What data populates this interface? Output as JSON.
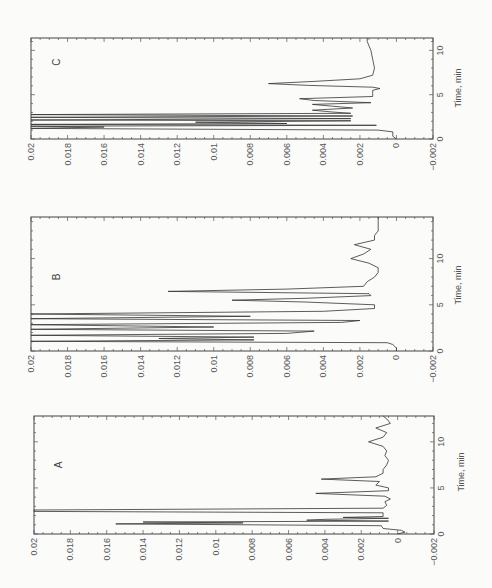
{
  "chart_data": [
    {
      "type": "line",
      "panel": "C",
      "title": "C",
      "xlabel": "Time, min",
      "ylabel": "",
      "xlim": [
        0,
        11.4
      ],
      "ylim": [
        -0.002,
        0.02
      ],
      "x_ticks": [
        0,
        5,
        10
      ],
      "y_ticks": [
        "0.02",
        "0.018",
        "0.016",
        "0.014",
        "0.012",
        "0.01",
        "0.008",
        "0.006",
        "0.004",
        "0.002",
        "0",
        "-0.002"
      ],
      "orientation": "rotated 90deg (value axis horizontal, time axis vertical)",
      "series": [
        {
          "name": "C",
          "x": [
            0,
            0.3,
            0.8,
            1.0,
            1.2,
            1.35,
            1.45,
            1.55,
            1.65,
            1.75,
            1.9,
            2.05,
            2.15,
            2.3,
            2.45,
            2.6,
            2.75,
            2.9,
            3.05,
            3.25,
            3.5,
            3.7,
            3.9,
            4.1,
            4.35,
            4.55,
            4.8,
            5.1,
            5.5,
            5.7,
            5.85,
            6.05,
            6.25,
            6.5,
            6.8,
            7.2,
            8,
            9,
            10,
            11,
            11.4
          ],
          "y": [
            0,
            0.0002,
            0.0002,
            0.001,
            0.02,
            0.016,
            0.02,
            0.0011,
            0.02,
            0.006,
            0.011,
            0.0025,
            0.02,
            0.0025,
            0.02,
            0.0024,
            0.02,
            0.0025,
            0.0035,
            0.0046,
            0.0024,
            0.0035,
            0.0046,
            0.0014,
            0.0045,
            0.0053,
            0.0013,
            0.0013,
            0.0013,
            0.0009,
            0.0013,
            0.0048,
            0.007,
            0.0045,
            0.002,
            0.0013,
            0.0012,
            0.0013,
            0.0014,
            0.0016,
            0.0016
          ]
        }
      ]
    },
    {
      "type": "line",
      "panel": "B",
      "title": "B",
      "xlabel": "Time, min",
      "ylabel": "",
      "xlim": [
        0,
        14.5
      ],
      "ylim": [
        -0.002,
        0.02
      ],
      "x_ticks": [
        0,
        5,
        10
      ],
      "y_ticks": [
        "0.02",
        "0.018",
        "0.016",
        "0.014",
        "0.012",
        "0.01",
        "0.008",
        "0.006",
        "0.004",
        "0.002",
        "0",
        "-0.002"
      ],
      "orientation": "rotated 90deg (value axis horizontal, time axis vertical)",
      "series": [
        {
          "name": "B",
          "x": [
            0,
            0.3,
            0.7,
            0.9,
            1.05,
            1.2,
            1.35,
            1.5,
            1.7,
            1.9,
            2.15,
            2.35,
            2.6,
            2.85,
            3.1,
            3.3,
            3.5,
            3.75,
            4.0,
            4.3,
            4.6,
            5.0,
            5.3,
            5.5,
            5.7,
            6.0,
            6.2,
            6.45,
            6.7,
            7.0,
            7.5,
            8,
            8.5,
            9,
            9.5,
            10,
            10.5,
            11,
            11.5,
            12,
            12.5,
            13,
            14,
            14.5
          ],
          "y": [
            0,
            0,
            0.0002,
            0.0005,
            0.02,
            0.0078,
            0.013,
            0.0078,
            0.02,
            0.006,
            0.0045,
            0.02,
            0.01,
            0.02,
            0.003,
            0.002,
            0.02,
            0.008,
            0.02,
            0.004,
            0.0012,
            0.0012,
            0.005,
            0.009,
            0.005,
            0.0014,
            0.0015,
            0.0125,
            0.006,
            0.0018,
            0.0016,
            0.0012,
            0.001,
            0.001,
            0.0015,
            0.0025,
            0.0018,
            0.0014,
            0.0023,
            0.0012,
            0.0012,
            0.001,
            0.001,
            0.001
          ]
        }
      ]
    },
    {
      "type": "line",
      "panel": "A",
      "title": "A",
      "xlabel": "Time, min",
      "ylabel": "",
      "xlim": [
        0,
        12.8
      ],
      "ylim": [
        -0.002,
        0.02
      ],
      "x_ticks": [
        0,
        5,
        10
      ],
      "y_ticks": [
        "0.02",
        "0.018",
        "0.016",
        "0.014",
        "0.012",
        "0.01",
        "0.008",
        "0.006",
        "0.004",
        "0.002",
        "0",
        "-0.002"
      ],
      "orientation": "rotated 90deg (value axis horizontal, time axis vertical)",
      "series": [
        {
          "name": "A",
          "x": [
            0,
            0.2,
            0.4,
            0.6,
            0.9,
            1.1,
            1.2,
            1.3,
            1.4,
            1.5,
            1.6,
            1.7,
            1.8,
            1.9,
            2.1,
            2.3,
            2.45,
            2.6,
            2.8,
            3.1,
            3.5,
            3.8,
            4.1,
            4.4,
            4.7,
            5.0,
            5.3,
            5.7,
            5.95,
            6.2,
            6.6,
            7,
            7.5,
            8,
            8.5,
            9,
            9.5,
            10,
            10.5,
            11,
            11.5,
            12,
            12.5,
            12.8
          ],
          "y": [
            0,
            -0.0004,
            -0.0002,
            0.0008,
            0.0009,
            0.0155,
            0.0085,
            0.014,
            0.0005,
            0.005,
            0.004,
            0.0005,
            0.003,
            0.0008,
            0.0008,
            0.0008,
            0.02,
            0.02,
            0.0008,
            0.0006,
            0.0007,
            0.0004,
            0.0007,
            0.0045,
            0.0005,
            0.0005,
            0.0012,
            0.001,
            0.0042,
            0.0012,
            0.0008,
            0.0008,
            0.0006,
            0.0005,
            0.0007,
            0.0006,
            0.0008,
            0.0016,
            0.0008,
            0.0006,
            0.0012,
            0.0004,
            0.0006,
            0.0008
          ]
        }
      ]
    }
  ],
  "panels": [
    {
      "id": "C",
      "label": "C",
      "y_tick_labels": [
        "0.02",
        "0.018",
        "0.016",
        "0.014",
        "0.012",
        "0.01",
        "0.008",
        "0.006",
        "0.004",
        "0.002",
        "0",
        "−0.002"
      ],
      "time_tick_labels": [
        "0",
        "5",
        "10"
      ],
      "time_label": "Time, min"
    },
    {
      "id": "B",
      "label": "B",
      "y_tick_labels": [
        "0.02",
        "0.018",
        "0.016",
        "0.014",
        "0.012",
        "0.01",
        "0.008",
        "0.006",
        "0.004",
        "0.002",
        "0",
        "−0.002"
      ],
      "time_tick_labels": [
        "0",
        "5",
        "10"
      ],
      "time_label": "Time, min"
    },
    {
      "id": "A",
      "label": "A",
      "y_tick_labels": [
        "0.02",
        "0.018",
        "0.016",
        "0.014",
        "0.012",
        "0.01",
        "0.008",
        "0.006",
        "0.004",
        "0.002",
        "0",
        "−0.002"
      ],
      "time_tick_labels": [
        "0",
        "5",
        "10"
      ],
      "time_label": "Time, min"
    }
  ]
}
